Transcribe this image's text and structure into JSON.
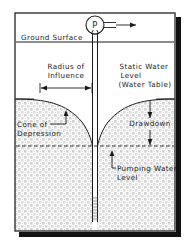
{
  "diagram": {
    "labels": {
      "ground_surface": "Ground Surface",
      "radius_of_influence_line1": "Radius of",
      "radius_of_influence_line2": "Influence",
      "static_water_line1": "Static Water",
      "static_water_line2": "Level",
      "static_water_line3": "(Water Table)",
      "cone_line1": "Cone of",
      "cone_line2": "Depression",
      "drawdown": "Drawdown",
      "pumping_line1": "Pumping Water",
      "pumping_line2": "Level",
      "pump_symbol": "P"
    },
    "icons": {
      "pump": "pump-circle-icon",
      "discharge": "discharge-arrow-icon",
      "radius_dimension": "double-arrow-horizontal-icon",
      "drawdown_dimension": "double-arrow-vertical-icon",
      "cone_leader": "leader-line-icon",
      "pumping_leader": "leader-line-icon"
    },
    "colors": {
      "line": "#1a1a1a",
      "background": "#ffffff",
      "aquifer_stipple": "#c8c8c8",
      "shadow": "#111111",
      "frame": "#333333"
    },
    "geometry": {
      "frame": {
        "x": 14,
        "y": 12,
        "width": 162,
        "height": 220
      },
      "ground_surface_y": 42,
      "static_water_level_y": 99,
      "pumping_water_level_y": 146,
      "well_center_x": 95,
      "well_casing_half_width": 2.5,
      "well_bottom_y": 222,
      "screen_top_y": 196,
      "radius_dimension": {
        "x1": 40,
        "x2": 92,
        "y": 88
      },
      "drawdown_dimension": {
        "x": 150,
        "y1": 101,
        "y2": 144
      }
    }
  }
}
